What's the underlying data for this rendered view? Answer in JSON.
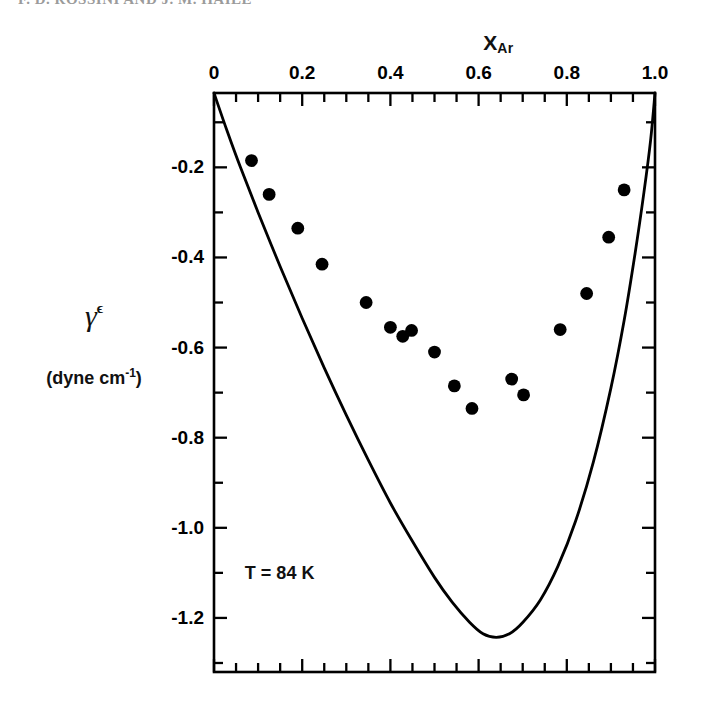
{
  "running_head": "F. D. ROSSINI AND J. M. HAILE",
  "annotation": {
    "temperature": "T = 84 K"
  },
  "axis_titles": {
    "x_main": "X",
    "x_sub": "Ar",
    "y_symbol": "γ",
    "y_superscript": "ϵ",
    "y_units_prefix": "(dyne cm",
    "y_units_exponent": "-1",
    "y_units_suffix": ")"
  },
  "chart_data": {
    "type": "scatter",
    "title": "",
    "subtitle": "",
    "xlabel": "X_Ar",
    "ylabel": "γᴱ (dyne cm⁻¹)",
    "xlim": [
      0,
      1
    ],
    "ylim": [
      -1.32,
      -0.035
    ],
    "grid": false,
    "legend": "none",
    "annotations": [
      "T = 84 K"
    ],
    "xticks": [
      0,
      0.2,
      0.4,
      0.6,
      0.8,
      1.0
    ],
    "xtick_labels": [
      "0",
      "0.2",
      "0.4",
      "0.6",
      "0.8",
      "1.0"
    ],
    "xminor_step": 0.05,
    "yticks": [
      -0.2,
      -0.4,
      -0.6,
      -0.8,
      -1.0,
      -1.2
    ],
    "ytick_labels": [
      "-0.2",
      "-0.4",
      "-0.6",
      "-0.8",
      "-1.0",
      "-1.2"
    ],
    "yminor_step": 0.1,
    "series": [
      {
        "name": "experimental points",
        "type": "scatter",
        "marker": "filled-circle",
        "color": "#000000",
        "points": [
          [
            0.085,
            -0.185
          ],
          [
            0.125,
            -0.26
          ],
          [
            0.19,
            -0.335
          ],
          [
            0.245,
            -0.415
          ],
          [
            0.345,
            -0.5
          ],
          [
            0.4,
            -0.555
          ],
          [
            0.428,
            -0.575
          ],
          [
            0.448,
            -0.562
          ],
          [
            0.5,
            -0.61
          ],
          [
            0.545,
            -0.685
          ],
          [
            0.585,
            -0.735
          ],
          [
            0.675,
            -0.67
          ],
          [
            0.702,
            -0.705
          ],
          [
            0.785,
            -0.56
          ],
          [
            0.845,
            -0.48
          ],
          [
            0.895,
            -0.355
          ],
          [
            0.93,
            -0.25
          ]
        ]
      },
      {
        "name": "theoretical curve",
        "type": "line",
        "color": "#000000",
        "points": [
          [
            0.0,
            -0.035
          ],
          [
            0.03,
            -0.12
          ],
          [
            0.06,
            -0.2
          ],
          [
            0.1,
            -0.3
          ],
          [
            0.15,
            -0.42
          ],
          [
            0.2,
            -0.535
          ],
          [
            0.25,
            -0.645
          ],
          [
            0.3,
            -0.75
          ],
          [
            0.35,
            -0.85
          ],
          [
            0.4,
            -0.945
          ],
          [
            0.45,
            -1.03
          ],
          [
            0.5,
            -1.11
          ],
          [
            0.54,
            -1.165
          ],
          [
            0.58,
            -1.21
          ],
          [
            0.61,
            -1.235
          ],
          [
            0.64,
            -1.243
          ],
          [
            0.67,
            -1.235
          ],
          [
            0.7,
            -1.21
          ],
          [
            0.74,
            -1.16
          ],
          [
            0.78,
            -1.085
          ],
          [
            0.82,
            -0.985
          ],
          [
            0.86,
            -0.855
          ],
          [
            0.9,
            -0.69
          ],
          [
            0.93,
            -0.54
          ],
          [
            0.955,
            -0.39
          ],
          [
            0.975,
            -0.255
          ],
          [
            0.99,
            -0.14
          ],
          [
            1.0,
            -0.035
          ]
        ]
      }
    ]
  },
  "plot_geometry": {
    "left_px": 214,
    "right_px": 655,
    "top_px": 93,
    "bottom_px": 672,
    "x_min": 0,
    "x_max": 1,
    "y_at_top": -0.035,
    "y_at_bottom": -1.32
  }
}
